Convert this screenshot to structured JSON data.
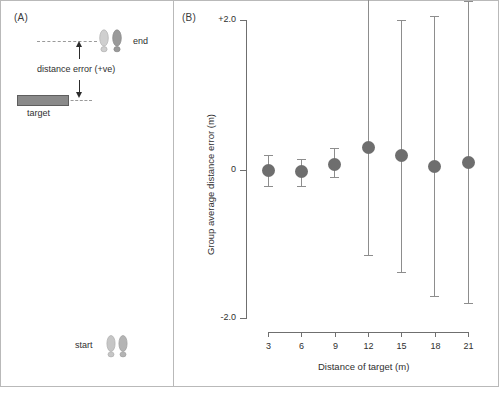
{
  "figure": {
    "panels": [
      {
        "id": "A",
        "label": "(A)"
      },
      {
        "id": "B",
        "label": "(B)"
      }
    ]
  },
  "panel_a": {
    "label": "(A)",
    "annotations": {
      "end_label": "end",
      "start_label": "start",
      "target_label": "target",
      "distance_error_label": "distance error (+ve)"
    },
    "icons": {
      "end_footprints": "footprint-pair-icon",
      "start_footprints": "footprint-pair-icon",
      "target_bar": "target-bar-icon",
      "up_arrow": "arrow-up-icon",
      "down_arrow": "arrow-down-icon"
    }
  },
  "panel_b": {
    "label": "(B)"
  },
  "chart_data": {
    "type": "scatter",
    "title": "",
    "xlabel": "Distance of target (m)",
    "ylabel": "Group average distance error (m)",
    "x": [
      3,
      6,
      9,
      12,
      15,
      18,
      21
    ],
    "xticklabels": [
      "3",
      "6",
      "9",
      "12",
      "15",
      "18",
      "21"
    ],
    "yticks": [
      2.0,
      0,
      -2.0
    ],
    "yticklabels": [
      "+2.0",
      "0",
      "-2.0"
    ],
    "ylim": [
      -2.0,
      2.0
    ],
    "xlim": [
      3,
      21
    ],
    "grid": false,
    "legend": null,
    "series": [
      {
        "name": "Group average distance error",
        "values": [
          0.0,
          -0.02,
          0.07,
          0.3,
          0.2,
          0.05,
          0.1
        ],
        "err_upper": [
          0.2,
          0.17,
          0.22,
          1.99,
          1.8,
          2.0,
          2.15
        ],
        "err_lower": [
          0.22,
          0.2,
          0.17,
          1.45,
          1.58,
          1.75,
          1.9
        ],
        "marker": "filled-circle",
        "marker_color": "#6e6e6e",
        "errorbar_color": "#8d8d8d"
      }
    ]
  },
  "colors": {
    "marker": "#6e6e6e",
    "errorbar": "#8d8d8d",
    "axis": "#6f6f6f",
    "text": "#2f2f2f",
    "frame": "#b9b9b9",
    "target_fill": "#8a8a8a",
    "footprint_light": "#cfcfcf",
    "footprint_dark": "#9a9a9a"
  }
}
